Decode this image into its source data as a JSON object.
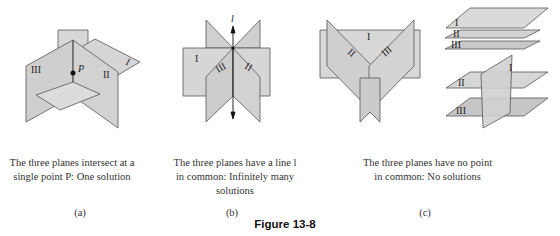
{
  "figure": {
    "title": "Figure 13-8",
    "plane_fill": "#d4d4d4",
    "plane_fill_dark": "#c4c4c4",
    "stroke": "#555555",
    "panels": [
      {
        "id": "a",
        "label": "(a)",
        "caption_line1": "The three planes intersect at a",
        "caption_line2": "single point P: One solution",
        "plane_labels": [
          "I",
          "II",
          "III"
        ],
        "point_label": "P"
      },
      {
        "id": "b",
        "label": "(b)",
        "caption_line1": "The three planes have a line l",
        "caption_line2": "in common: Infinitely many",
        "caption_line3": "solutions",
        "plane_labels": [
          "I",
          "II",
          "III"
        ],
        "line_label": "l"
      },
      {
        "id": "c",
        "label": "(c)",
        "caption_line1": "The three planes have no point",
        "caption_line2": "in common: No solutions",
        "plane_labels": [
          "I",
          "II",
          "III"
        ]
      }
    ]
  }
}
